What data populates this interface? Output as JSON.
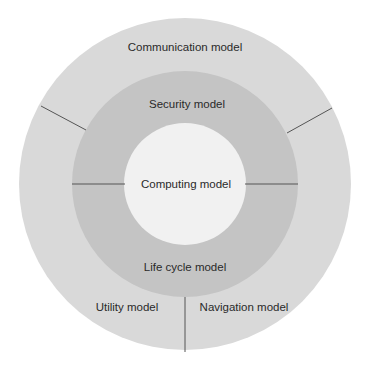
{
  "diagram": {
    "type": "concentric-layered-model",
    "colors": {
      "outer_ring": "#d9d9d9",
      "middle_ring": "#c4c4c4",
      "inner_circle": "#f1f1f1",
      "divider": "#555555",
      "background": "#ffffff",
      "text": "#2a2a2a"
    },
    "outer_ring": {
      "segments": [
        {
          "id": "communication",
          "label": "Communication model"
        },
        {
          "id": "utility",
          "label": "Utility model"
        },
        {
          "id": "navigation",
          "label": "Navigation model"
        }
      ]
    },
    "middle_ring": {
      "segments": [
        {
          "id": "security",
          "label": "Security model"
        },
        {
          "id": "lifecycle",
          "label": "Life cycle model"
        }
      ]
    },
    "core": {
      "id": "computing",
      "label": "Computing model"
    }
  }
}
